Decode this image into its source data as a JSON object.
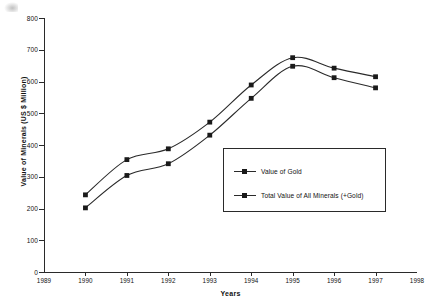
{
  "chart_data": {
    "type": "line",
    "title": "",
    "xlabel": "Years",
    "ylabel": "Value of Minerals (US $ Million)",
    "xlim": [
      1989,
      1998
    ],
    "ylim": [
      0,
      800
    ],
    "ytick_step": 100,
    "grid": false,
    "legend_position": "center-right",
    "x": [
      1990,
      1991,
      1992,
      1993,
      1994,
      1995,
      1996,
      1997
    ],
    "xticks": [
      "1989",
      "1990",
      "1991",
      "1992",
      "1993",
      "1994",
      "1995",
      "1996",
      "1997",
      "1998"
    ],
    "yticks": [
      "0",
      "100",
      "200",
      "300",
      "400",
      "500",
      "600",
      "700",
      "800"
    ],
    "series": [
      {
        "name": "Total Value of All Minerals (+Gold)",
        "marker": "square",
        "values": [
          243,
          354,
          388,
          472,
          589,
          675,
          642,
          615
        ]
      },
      {
        "name": "Value of Gold",
        "marker": "square",
        "values": [
          202,
          304,
          341,
          431,
          547,
          648,
          612,
          580
        ]
      }
    ]
  },
  "legend": {
    "items": [
      {
        "label": "Value of Gold"
      },
      {
        "label": "Total Value of All Minerals (+Gold)"
      }
    ]
  },
  "colors": {
    "line": "#2a2a2a",
    "marker": "#1a1a1a",
    "text": "#111111",
    "background": "#ffffff"
  }
}
